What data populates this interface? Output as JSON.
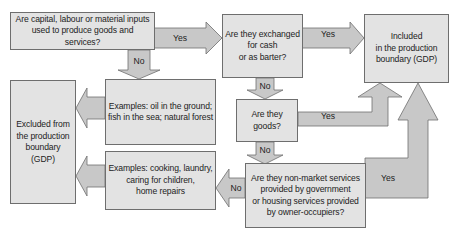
{
  "diagram": {
    "type": "flowchart",
    "colors": {
      "box_fill": "#e3e3e3",
      "box_border": "#6e6e6e",
      "arrow_fill": "#c8c8c8",
      "arrow_border": "#6e6e6e",
      "text": "#222222"
    },
    "nodes": {
      "inputs_question": "Are capital, labour or material inputs\nused to produce goods and services?",
      "exchanged_question": "Are they exchanged\nfor cash\nor as barter?",
      "included": "Included\nin the production\nboundary (GDP)",
      "examples_natural": "Examples: oil in the ground;\nfish in the sea; natural forest",
      "excluded": "Excluded from\nthe production\nboundary (GDP)",
      "goods_question": "Are they goods?",
      "nonmarket_question": "Are they non-market services\nprovided by government\nor housing services provided\nby owner-occupiers?",
      "examples_household": "Examples: cooking, laundry,\ncaring for children,\nhome repairs"
    },
    "edges": {
      "inputs_to_exchanged": "Yes",
      "inputs_to_examples_natural": "No",
      "exchanged_to_included": "Yes",
      "exchanged_to_goods": "No",
      "goods_to_included": "Yes",
      "goods_to_nonmarket": "No",
      "nonmarket_to_included": "Yes",
      "nonmarket_to_examples_household": "No"
    }
  }
}
